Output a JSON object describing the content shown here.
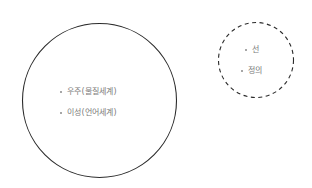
{
  "diagram": {
    "circles": [
      {
        "id": "large",
        "style": "solid",
        "stroke": "#2a2a2a",
        "items": [
          "우주(물질세계)",
          "이성(언어세계)"
        ]
      },
      {
        "id": "small",
        "style": "dashed",
        "stroke": "#2a2a2a",
        "items": [
          "선",
          "정의"
        ]
      }
    ]
  }
}
